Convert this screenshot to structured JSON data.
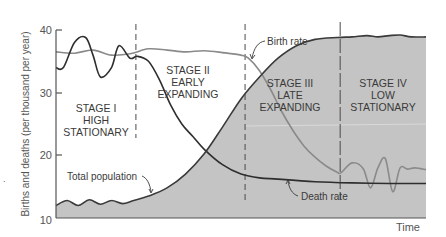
{
  "chart_data": {
    "type": "line",
    "title": "",
    "xlabel": "Time",
    "ylabel": "Births and deaths (per thousand per year)",
    "ylim": [
      10,
      40
    ],
    "yticks": [
      10,
      20,
      30,
      40
    ],
    "xlim": [
      0,
      100
    ],
    "grid": false,
    "legend": "none (inline annotations)",
    "stage_boundaries_x": [
      21.6,
      51.1,
      76.8
    ],
    "stages": [
      {
        "label_lines": [
          "STAGE I",
          "HIGH",
          "STATIONARY"
        ],
        "x_center": 10.5
      },
      {
        "label_lines": [
          "STAGE II",
          "EARLY",
          "EXPANDING"
        ],
        "x_center": 36
      },
      {
        "label_lines": [
          "STAGE III",
          "LATE",
          "EXPANDING"
        ],
        "x_center": 64.5
      },
      {
        "label_lines": [
          "STAGE IV",
          "LOW",
          "STATIONARY"
        ],
        "x_center": 88
      }
    ],
    "series": [
      {
        "name": "Birth rate",
        "style": "gray line",
        "x": [
          0,
          5,
          10,
          15,
          20,
          25,
          30,
          35,
          40,
          45,
          50,
          52,
          55,
          58,
          61,
          64,
          67,
          70,
          73,
          76,
          77,
          80,
          83,
          85,
          87,
          89,
          91,
          93,
          95,
          97,
          100
        ],
        "values": [
          36.5,
          36.3,
          36.8,
          36.0,
          36.2,
          37.0,
          36.8,
          36.5,
          36.7,
          36.4,
          36.0,
          35.5,
          33.5,
          30.5,
          27.0,
          24.0,
          21.5,
          19.7,
          18.3,
          17.3,
          17.2,
          18.8,
          17.9,
          14.8,
          18.0,
          19.5,
          14.2,
          18.0,
          17.8,
          18.0,
          17.7
        ]
      },
      {
        "name": "Death rate",
        "style": "dark line",
        "x": [
          0,
          2,
          5,
          8,
          10,
          12,
          15,
          17,
          20,
          22,
          25,
          28,
          31,
          34,
          37,
          40,
          45,
          50,
          55,
          60,
          70,
          80,
          90,
          100
        ],
        "values": [
          34.0,
          34.0,
          38.0,
          38.8,
          36.0,
          32.5,
          34.0,
          37.5,
          35.5,
          35.8,
          35.0,
          32.0,
          28.0,
          25.0,
          23.0,
          21.0,
          18.5,
          17.0,
          16.4,
          16.2,
          15.8,
          15.6,
          15.5,
          15.5
        ]
      },
      {
        "name": "Total population",
        "style": "dark line, gray filled area below",
        "x": [
          0,
          3,
          6,
          9,
          12,
          15,
          18,
          21,
          25,
          30,
          35,
          40,
          45,
          50,
          55,
          60,
          65,
          70,
          76,
          80,
          84,
          87,
          90,
          93,
          96,
          100
        ],
        "values": [
          12.0,
          12.8,
          12.0,
          12.9,
          12.2,
          12.8,
          12.3,
          12.8,
          13.5,
          14.8,
          17.0,
          20.2,
          24.5,
          29.0,
          32.5,
          35.5,
          37.5,
          38.5,
          38.8,
          38.9,
          39.1,
          38.9,
          39.1,
          39.2,
          38.9,
          38.9
        ]
      }
    ],
    "annotations": [
      "Birth rate",
      "Death rate",
      "Total population"
    ]
  },
  "labels": {
    "ylabel": "Births and deaths (per thousand per year)",
    "xlabel": "Time",
    "yticks": [
      "40",
      "30",
      "20",
      "10"
    ],
    "birth_rate": "Birth rate",
    "death_rate": "Death rate",
    "total_population": "Total population",
    "stage1": [
      "STAGE I",
      "HIGH",
      "STATIONARY"
    ],
    "stage2": [
      "STAGE II",
      "EARLY",
      "EXPANDING"
    ],
    "stage3": [
      "STAGE III",
      "LATE",
      "EXPANDING"
    ],
    "stage4": [
      "STAGE IV",
      "LOW",
      "STATIONARY"
    ]
  },
  "colors": {
    "fill": "#c4c4c4",
    "birth_line": "#8a8a8a",
    "death_line": "#2e2e2e",
    "population_line": "#3a3a3a",
    "axis": "#555555"
  }
}
